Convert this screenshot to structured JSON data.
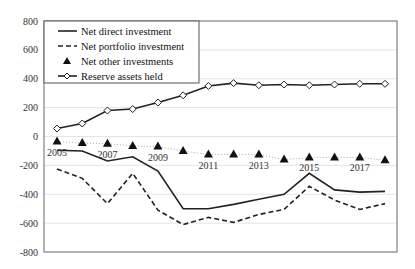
{
  "chart_data": {
    "type": "line",
    "title": "",
    "xlabel": "",
    "ylabel": "",
    "ylim": [
      -800,
      800
    ],
    "yticks": [
      800,
      600,
      400,
      200,
      0,
      -200,
      -400,
      -600,
      -800
    ],
    "grid": true,
    "legend_position": "top-left",
    "x": [
      2005,
      2006,
      2007,
      2008,
      2009,
      2010,
      2011,
      2012,
      2013,
      2014,
      2015,
      2016,
      2017,
      2018
    ],
    "year_labels": [
      "2005",
      "2007",
      "2009",
      "2011",
      "2013",
      "2015",
      "2017"
    ],
    "series": [
      {
        "name": "Net direct investment",
        "style": "solid",
        "marker": "none",
        "values": [
          -95,
          -100,
          -170,
          -140,
          -240,
          -500,
          -500,
          -470,
          -435,
          -400,
          -255,
          -370,
          -385,
          -380
        ]
      },
      {
        "name": "Net portfolio investment",
        "style": "dashed",
        "marker": "none",
        "values": [
          -225,
          -290,
          -465,
          -255,
          -510,
          -610,
          -560,
          -595,
          -540,
          -505,
          -345,
          -440,
          -505,
          -465
        ]
      },
      {
        "name": "Net other investments",
        "style": "dotted",
        "marker": "triangle",
        "values": [
          -35,
          -45,
          -50,
          -65,
          -70,
          -100,
          -125,
          -125,
          -125,
          -160,
          -145,
          -145,
          -145,
          -165
        ]
      },
      {
        "name": "Reserve assets held",
        "style": "solid",
        "marker": "diamond",
        "values": [
          55,
          90,
          180,
          190,
          235,
          285,
          350,
          370,
          355,
          360,
          355,
          360,
          365,
          365
        ]
      }
    ]
  }
}
